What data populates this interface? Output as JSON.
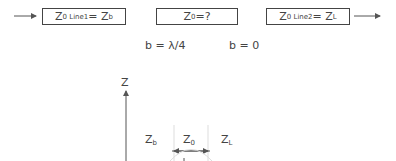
{
  "boxes": [
    {
      "main": "Z",
      "sub": "0 Line1",
      "rest": " = Z",
      "rest_sub": "b"
    },
    {
      "main": "Z",
      "sub": "0",
      "rest": " =?",
      "rest_sub": ""
    },
    {
      "main": "Z",
      "sub": "0 Line2",
      "rest": " = Z",
      "rest_sub": "L"
    }
  ],
  "labels": {
    "b_quarter": "b = λ/4",
    "b_zero": "b = 0"
  },
  "plot": {
    "axis_label": "Z",
    "zb": {
      "main": "Z",
      "sub": "b"
    },
    "z0": {
      "main": "Z",
      "sub": "0"
    },
    "zl": {
      "main": "Z",
      "sub": "L"
    }
  }
}
